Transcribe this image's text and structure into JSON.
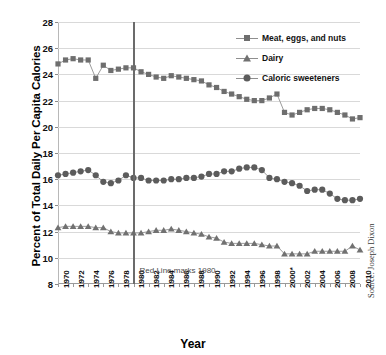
{
  "chart_data": {
    "type": "line",
    "title": "",
    "xlabel": "Year",
    "ylabel": "Percent of Total Daily Per Capita Calories",
    "ylim": [
      8,
      28
    ],
    "ytick_step": 2,
    "yticks": [
      28,
      26,
      24,
      22,
      20,
      18,
      16,
      14,
      12,
      10,
      8
    ],
    "xlim": [
      1970,
      2010
    ],
    "grid": true,
    "legend_position": "top-right",
    "x": [
      1970,
      1971,
      1972,
      1973,
      1974,
      1975,
      1976,
      1977,
      1978,
      1979,
      1980,
      1981,
      1982,
      1983,
      1984,
      1985,
      1986,
      1987,
      1988,
      1989,
      1990,
      1991,
      1992,
      1993,
      1994,
      1995,
      1996,
      1997,
      1998,
      1999,
      2000,
      2001,
      2002,
      2003,
      2004,
      2005,
      2006,
      2007,
      2008,
      2009,
      2010
    ],
    "xtick_labels": [
      "1970",
      "1972",
      "1974",
      "1976",
      "1978",
      "1980",
      "1982",
      "1984",
      "1986",
      "1988",
      "1990",
      "1992",
      "1994",
      "1996",
      "1998",
      "2000*",
      "2002",
      "2004",
      "2006",
      "2008",
      "2010"
    ],
    "xtick_values": [
      1970,
      1972,
      1974,
      1976,
      1978,
      1980,
      1982,
      1984,
      1986,
      1988,
      1990,
      1992,
      1994,
      1996,
      1998,
      2000,
      2002,
      2004,
      2006,
      2008,
      2010
    ],
    "series": [
      {
        "name": "Meat, eggs, and nuts",
        "marker": "square",
        "color": "#6e6e6e",
        "values": [
          24.8,
          25.1,
          25.2,
          25.1,
          25.1,
          23.7,
          24.7,
          24.3,
          24.4,
          24.5,
          24.5,
          24.2,
          24.0,
          23.8,
          23.7,
          23.9,
          23.8,
          23.7,
          23.6,
          23.5,
          23.2,
          23.0,
          22.7,
          22.5,
          22.3,
          22.1,
          22.0,
          22.0,
          22.2,
          22.5,
          21.1,
          20.9,
          21.1,
          21.3,
          21.4,
          21.4,
          21.3,
          21.1,
          20.9,
          20.6,
          20.7
        ]
      },
      {
        "name": "Dairy",
        "marker": "triangle",
        "color": "#717171",
        "values": [
          12.3,
          12.4,
          12.4,
          12.4,
          12.4,
          12.3,
          12.3,
          12.0,
          11.9,
          11.9,
          11.9,
          11.9,
          12.0,
          12.1,
          12.1,
          12.2,
          12.1,
          12.0,
          11.9,
          11.8,
          11.6,
          11.5,
          11.2,
          11.1,
          11.1,
          11.1,
          11.1,
          11.0,
          10.9,
          10.9,
          10.3,
          10.3,
          10.3,
          10.3,
          10.5,
          10.5,
          10.5,
          10.5,
          10.5,
          10.9,
          10.6
        ]
      },
      {
        "name": "Caloric sweeteners",
        "marker": "circle",
        "color": "#5c5c5c",
        "values": [
          16.3,
          16.4,
          16.5,
          16.6,
          16.7,
          16.3,
          15.8,
          15.7,
          15.9,
          16.3,
          16.1,
          16.1,
          15.9,
          15.9,
          15.9,
          16.0,
          16.0,
          16.1,
          16.1,
          16.2,
          16.4,
          16.4,
          16.6,
          16.6,
          16.8,
          16.9,
          16.9,
          16.7,
          16.1,
          16.0,
          15.8,
          15.7,
          15.5,
          15.1,
          15.2,
          15.2,
          14.9,
          14.5,
          14.4,
          14.4,
          14.5
        ]
      }
    ],
    "annotations": [
      {
        "name": "red-line-1980",
        "text": "Red Line marks 1980",
        "x": 1980,
        "color": "#6b6b6b"
      }
    ],
    "source": "Source: Joseph Dixon"
  }
}
